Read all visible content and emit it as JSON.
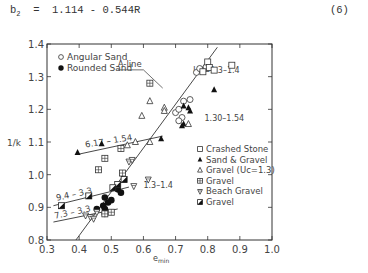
{
  "equation": {
    "lhs": "b",
    "lhs_sub": "2",
    "rhs": "=  1.114 - 0.544R",
    "number": "(6)"
  },
  "chart_data": {
    "type": "scatter",
    "title": "",
    "xlabel": "e_min",
    "ylabel": "1/k",
    "xlim": [
      0.3,
      1.0
    ],
    "ylim": [
      0.8,
      1.4
    ],
    "x_ticks": [
      "0.3",
      "0.4",
      "0.5",
      "0.6",
      "0.7",
      "0.8",
      "0.9",
      "1.0"
    ],
    "y_ticks": [
      "0.8",
      "0.9",
      "1.0",
      "1.1",
      "1.2",
      "1.3",
      "1.4"
    ],
    "grid": false,
    "legend_position": "upper-left and lower-right inside plot",
    "legends": {
      "upper_left": [
        {
          "marker": "open-circle",
          "label": "Angular Sand"
        },
        {
          "marker": "filled-circle",
          "label": "Rounded Sand"
        }
      ],
      "lower_right": [
        {
          "marker": "open-square",
          "label": "Crashed Stone"
        },
        {
          "marker": "filled-triangle",
          "label": "Sand & Gravel"
        },
        {
          "marker": "open-triangle",
          "label": "Gravel (Uc=1.3)"
        },
        {
          "marker": "crossed-square",
          "label": "Gravel"
        },
        {
          "marker": "crossed-down-triangle",
          "label": "Beach Gravel"
        },
        {
          "marker": "half-filled-square",
          "label": "Gravel"
        }
      ]
    },
    "lines": [
      {
        "name": "A-line",
        "label": "A-line",
        "x": [
          0.39,
          0.83
        ],
        "y": [
          0.8,
          1.39
        ]
      },
      {
        "name": "6.17-1.54",
        "label": "6.17 – 1.54",
        "x": [
          0.4,
          0.66
        ],
        "y": [
          1.063,
          1.118
        ]
      },
      {
        "name": "9.4-3.3",
        "label": "9.4 – 3.3",
        "x": [
          0.32,
          0.555
        ],
        "y": [
          0.905,
          0.962
        ]
      },
      {
        "name": "7.3-3.3",
        "label": "7.3 – 3.3",
        "x": [
          0.32,
          0.52
        ],
        "y": [
          0.855,
          0.895
        ]
      }
    ],
    "annotations": [
      {
        "text": "Uc=1.3–1.4",
        "x": 0.755,
        "y": 1.312
      },
      {
        "text": "1.30–1.54",
        "x": 0.79,
        "y": 1.165
      },
      {
        "text": "1.3–1.4",
        "x": 0.6,
        "y": 0.96
      }
    ],
    "series": [
      {
        "name": "Angular Sand",
        "marker": "open-circle",
        "points": [
          [
            0.765,
            1.313
          ],
          [
            0.775,
            1.325
          ],
          [
            0.795,
            1.33
          ],
          [
            0.725,
            1.225
          ],
          [
            0.7,
            1.19
          ],
          [
            0.71,
            1.2
          ],
          [
            0.72,
            1.175
          ],
          [
            0.71,
            1.165
          ],
          [
            0.745,
            1.23
          ]
        ]
      },
      {
        "name": "Rounded Sand",
        "marker": "filled-circle",
        "points": [
          [
            0.48,
            0.93
          ],
          [
            0.49,
            0.915
          ],
          [
            0.5,
            0.922
          ],
          [
            0.475,
            0.905
          ],
          [
            0.48,
            0.895
          ],
          [
            0.52,
            0.955
          ],
          [
            0.53,
            0.945
          ],
          [
            0.455,
            0.895
          ],
          [
            0.48,
            0.88
          ]
        ]
      },
      {
        "name": "Crashed Stone",
        "marker": "open-square",
        "points": [
          [
            0.8,
            1.345
          ],
          [
            0.805,
            1.328
          ],
          [
            0.82,
            1.32
          ],
          [
            0.785,
            1.315
          ],
          [
            0.875,
            1.335
          ]
        ]
      },
      {
        "name": "Sand & Gravel",
        "marker": "filled-triangle",
        "points": [
          [
            0.725,
            1.21
          ],
          [
            0.74,
            1.205
          ],
          [
            0.745,
            1.195
          ],
          [
            0.82,
            1.26
          ],
          [
            0.72,
            1.15
          ],
          [
            0.725,
            1.155
          ],
          [
            0.47,
            1.095
          ],
          [
            0.395,
            1.068
          ],
          [
            0.655,
            1.11
          ]
        ]
      },
      {
        "name": "Gravel (Uc=1.3)",
        "marker": "open-triangle",
        "points": [
          [
            0.62,
            1.225
          ],
          [
            0.595,
            1.18
          ],
          [
            0.665,
            1.205
          ],
          [
            0.665,
            1.195
          ],
          [
            0.62,
            1.1
          ],
          [
            0.575,
            1.1
          ],
          [
            0.74,
            1.155
          ],
          [
            0.55,
            1.09
          ]
        ]
      },
      {
        "name": "Gravel (crossed)",
        "marker": "crossed-square",
        "points": [
          [
            0.62,
            1.28
          ],
          [
            0.48,
            1.05
          ],
          [
            0.53,
            1.08
          ],
          [
            0.46,
            1.015
          ],
          [
            0.48,
            0.88
          ],
          [
            0.5,
            0.885
          ],
          [
            0.535,
            1.005
          ]
        ]
      },
      {
        "name": "Beach Gravel",
        "marker": "crossed-down-triangle",
        "points": [
          [
            0.555,
            1.04
          ],
          [
            0.565,
            1.045
          ],
          [
            0.615,
            0.985
          ],
          [
            0.57,
            0.965
          ],
          [
            0.42,
            0.875
          ],
          [
            0.435,
            0.87
          ],
          [
            0.445,
            0.865
          ],
          [
            0.455,
            0.885
          ]
        ]
      },
      {
        "name": "Gravel (half-filled)",
        "marker": "half-filled-square",
        "points": [
          [
            0.345,
            0.905
          ],
          [
            0.43,
            0.935
          ],
          [
            0.54,
            0.985
          ],
          [
            0.52,
            0.97
          ],
          [
            0.505,
            0.96
          ]
        ]
      }
    ]
  }
}
